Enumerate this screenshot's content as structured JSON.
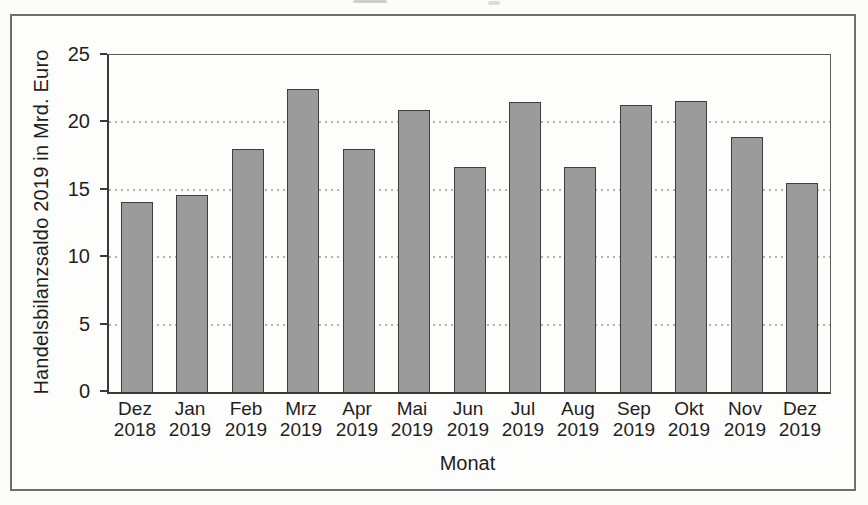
{
  "chart_data": {
    "type": "bar",
    "title": "",
    "xlabel": "Monat",
    "ylabel": "Handelsbilanzsaldo 2019 in Mrd. Euro",
    "categories": [
      {
        "month": "Dez",
        "year": "2018"
      },
      {
        "month": "Jan",
        "year": "2019"
      },
      {
        "month": "Feb",
        "year": "2019"
      },
      {
        "month": "Mrz",
        "year": "2019"
      },
      {
        "month": "Apr",
        "year": "2019"
      },
      {
        "month": "Mai",
        "year": "2019"
      },
      {
        "month": "Jun",
        "year": "2019"
      },
      {
        "month": "Jul",
        "year": "2019"
      },
      {
        "month": "Aug",
        "year": "2019"
      },
      {
        "month": "Sep",
        "year": "2019"
      },
      {
        "month": "Okt",
        "year": "2019"
      },
      {
        "month": "Nov",
        "year": "2019"
      },
      {
        "month": "Dez",
        "year": "2019"
      }
    ],
    "values": [
      14.1,
      14.6,
      18.0,
      22.5,
      18.0,
      20.9,
      16.7,
      21.5,
      16.7,
      21.3,
      21.6,
      18.9,
      15.5
    ],
    "ylim": [
      0,
      25
    ],
    "y_ticks": [
      0,
      5,
      10,
      15,
      20,
      25
    ],
    "gridline_values": [
      5,
      10,
      15,
      20
    ],
    "grid_style": "dotted horizontal",
    "legend": "none",
    "colors": {
      "bar_fill": "#9b9b9b",
      "bar_border": "#3e3e3e",
      "axis": "#3a3a3a",
      "gridline": "#b3b3b3",
      "frame_border": "#6e6e6e",
      "paper": "#fdfdfc",
      "text": "#1f1f1f"
    }
  }
}
